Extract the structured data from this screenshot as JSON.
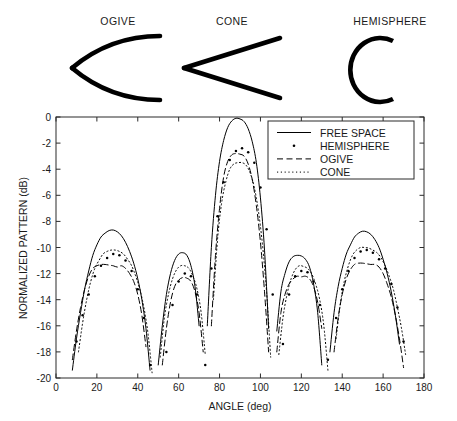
{
  "shapes": {
    "items": [
      {
        "name": "ogive",
        "label": "OGIVE",
        "icon": "ogive-shape-icon"
      },
      {
        "name": "cone",
        "label": "CONE",
        "icon": "cone-shape-icon"
      },
      {
        "name": "hemisphere",
        "label": "HEMISPHERE",
        "icon": "hemisphere-shape-icon"
      }
    ]
  },
  "chart_data": {
    "type": "line",
    "title": "",
    "xlabel": "ANGLE (deg)",
    "ylabel": "NORMALIZED PATTERN (dB)",
    "xlim": [
      0,
      180
    ],
    "ylim": [
      -20,
      0
    ],
    "xticks": [
      0,
      20,
      40,
      60,
      80,
      100,
      120,
      140,
      160,
      180
    ],
    "yticks": [
      0,
      -2,
      -4,
      -6,
      -8,
      -10,
      -12,
      -14,
      -16,
      -18,
      -20
    ],
    "xtick_labels": [
      "0",
      "20",
      "40",
      "60",
      "80",
      "100",
      "120",
      "140",
      "160",
      "180"
    ],
    "ytick_labels": [
      "0",
      "-2",
      "-4",
      "-6",
      "-8",
      "-10",
      "-12",
      "-14",
      "-16",
      "-18",
      "-20"
    ],
    "grid": false,
    "legend_position": "upper right",
    "legend": [
      {
        "name": "FREE SPACE",
        "style": "solid",
        "color": "#000000"
      },
      {
        "name": "HEMISPHERE",
        "style": "dotted-marker",
        "color": "#000000"
      },
      {
        "name": "OGIVE",
        "style": "dashed",
        "color": "#000000"
      },
      {
        "name": "CONE",
        "style": "dotted",
        "color": "#000000"
      }
    ],
    "lobes": {
      "description": "Five-lobe symmetric array pattern; nulls fall below -20 dB",
      "peak_angles": [
        28,
        61,
        90,
        119,
        152
      ],
      "null_angles": [
        8,
        45,
        52,
        70,
        110,
        128,
        135,
        172
      ]
    },
    "series": [
      {
        "name": "FREE SPACE",
        "style": "solid",
        "peaks": [
          {
            "angle": 28,
            "value": -8.7
          },
          {
            "angle": 61,
            "value": -10.4
          },
          {
            "angle": 90,
            "value": -0.2
          },
          {
            "angle": 119,
            "value": -10.6
          },
          {
            "angle": 152,
            "value": -8.8
          }
        ],
        "x": [
          6,
          8,
          10,
          12,
          14,
          16,
          18,
          20,
          22,
          24,
          26,
          28,
          30,
          32,
          34,
          36,
          38,
          40,
          42,
          44,
          46,
          48,
          50,
          52,
          54,
          56,
          58,
          60,
          62,
          64,
          66,
          68,
          70,
          72,
          74,
          76,
          78,
          80,
          82,
          84,
          86,
          88,
          90,
          92,
          94,
          96,
          98,
          100,
          102,
          104,
          106,
          108,
          110,
          112,
          114,
          116,
          118,
          120,
          122,
          124,
          126,
          128,
          130,
          132,
          134,
          136,
          138,
          140,
          142,
          144,
          146,
          148,
          150,
          152,
          154,
          156,
          158,
          160,
          162,
          164,
          166,
          168,
          170,
          172,
          174
        ],
        "y": [
          -20,
          -19.4,
          -17.0,
          -15.0,
          -13.2,
          -11.8,
          -10.6,
          -9.8,
          -9.2,
          -8.9,
          -8.7,
          -8.66,
          -8.8,
          -9.1,
          -9.6,
          -10.3,
          -11.2,
          -12.4,
          -14.0,
          -16.2,
          -19.4,
          -20,
          -19.0,
          -16.0,
          -13.6,
          -12.0,
          -11.0,
          -10.5,
          -10.4,
          -10.6,
          -11.4,
          -13.0,
          -16.0,
          -20,
          -16.0,
          -10.0,
          -6.0,
          -3.4,
          -1.8,
          -0.8,
          -0.3,
          -0.1,
          -0.15,
          -0.35,
          -0.9,
          -1.9,
          -3.5,
          -6.2,
          -10.2,
          -16.2,
          -20,
          -16.4,
          -13.4,
          -12.0,
          -11.1,
          -10.7,
          -10.6,
          -10.65,
          -10.9,
          -11.5,
          -12.8,
          -15.0,
          -19.0,
          -20,
          -18.0,
          -15.0,
          -13.0,
          -11.6,
          -10.5,
          -9.8,
          -9.2,
          -8.9,
          -8.75,
          -8.8,
          -9.0,
          -9.4,
          -10.0,
          -10.9,
          -12.0,
          -13.4,
          -15.2,
          -17.4,
          -20,
          -20,
          -20
        ]
      },
      {
        "name": "HEMISPHERE",
        "style": "dotted-marker",
        "peaks": [
          {
            "angle": 28,
            "value": -10.5
          },
          {
            "angle": 61,
            "value": -12.0
          },
          {
            "angle": 90,
            "value": -2.4
          },
          {
            "angle": 119,
            "value": -11.8
          },
          {
            "angle": 152,
            "value": -10.2
          }
        ],
        "x": [
          7,
          10,
          13,
          16,
          19,
          22,
          25,
          28,
          31,
          34,
          37,
          40,
          43,
          46,
          54,
          57,
          60,
          63,
          66,
          69,
          73,
          76,
          79,
          82,
          85,
          88,
          91,
          94,
          97,
          100,
          103,
          106,
          111,
          114,
          117,
          120,
          123,
          126,
          129,
          133,
          137,
          140,
          143,
          146,
          149,
          152,
          155,
          158,
          161,
          164,
          167,
          170,
          173
        ],
        "y": [
          -20,
          -17.2,
          -15.2,
          -13.6,
          -12.2,
          -11.4,
          -10.8,
          -10.5,
          -10.6,
          -11.0,
          -11.8,
          -13.2,
          -15.4,
          -19.0,
          -18.0,
          -14.4,
          -12.6,
          -12.0,
          -12.2,
          -13.6,
          -19.0,
          -11.6,
          -7.6,
          -5.0,
          -3.3,
          -2.6,
          -2.4,
          -2.7,
          -3.5,
          -5.4,
          -8.6,
          -13.6,
          -17.4,
          -13.6,
          -12.2,
          -11.8,
          -11.9,
          -12.6,
          -14.4,
          -18.6,
          -15.4,
          -13.2,
          -11.8,
          -10.8,
          -10.3,
          -10.2,
          -10.4,
          -10.9,
          -11.6,
          -12.8,
          -14.6,
          -17.2,
          -20
        ]
      },
      {
        "name": "OGIVE",
        "style": "dashed",
        "peaks": [
          {
            "angle": 28,
            "value": -11.4
          },
          {
            "angle": 61,
            "value": -12.3
          },
          {
            "angle": 90,
            "value": -2.8
          },
          {
            "angle": 119,
            "value": -12.2
          },
          {
            "angle": 152,
            "value": -11.2
          }
        ],
        "x": [
          6,
          8,
          10,
          12,
          14,
          16,
          18,
          20,
          22,
          24,
          26,
          28,
          30,
          32,
          34,
          36,
          38,
          40,
          42,
          44,
          46,
          48,
          52,
          54,
          56,
          58,
          60,
          62,
          64,
          66,
          68,
          70,
          72,
          74,
          76,
          78,
          80,
          82,
          84,
          86,
          88,
          90,
          92,
          94,
          96,
          98,
          100,
          102,
          104,
          106,
          108,
          110,
          112,
          114,
          116,
          118,
          120,
          122,
          124,
          126,
          128,
          130,
          134,
          136,
          138,
          140,
          142,
          144,
          146,
          148,
          150,
          152,
          154,
          156,
          158,
          160,
          162,
          164,
          166,
          168,
          170,
          172,
          174
        ],
        "y": [
          -20,
          -18.6,
          -16.4,
          -14.6,
          -13.2,
          -12.2,
          -11.6,
          -11.4,
          -11.3,
          -11.3,
          -11.35,
          -11.4,
          -11.5,
          -11.4,
          -11.6,
          -12.0,
          -12.6,
          -13.6,
          -15.2,
          -17.6,
          -20,
          -20,
          -19.0,
          -16.2,
          -14.2,
          -13.0,
          -12.5,
          -12.3,
          -12.35,
          -12.6,
          -13.4,
          -15.0,
          -18.0,
          -20,
          -16.0,
          -10.6,
          -7.0,
          -4.6,
          -3.4,
          -2.9,
          -2.8,
          -2.85,
          -3.0,
          -3.6,
          -4.8,
          -6.8,
          -9.6,
          -13.4,
          -18.0,
          -20,
          -18.0,
          -15.0,
          -13.6,
          -12.8,
          -12.4,
          -12.2,
          -12.25,
          -12.2,
          -12.4,
          -13.0,
          -14.2,
          -16.2,
          -20,
          -18.0,
          -15.4,
          -13.6,
          -12.4,
          -11.7,
          -11.3,
          -11.2,
          -11.2,
          -11.25,
          -11.3,
          -11.3,
          -11.5,
          -12.0,
          -12.8,
          -13.8,
          -15.2,
          -17.0,
          -19.2,
          -20,
          -20
        ]
      },
      {
        "name": "CONE",
        "style": "dotted",
        "peaks": [
          {
            "angle": 28,
            "value": -10.2
          },
          {
            "angle": 61,
            "value": -11.4
          },
          {
            "angle": 90,
            "value": -3.5
          },
          {
            "angle": 119,
            "value": -11.4
          },
          {
            "angle": 152,
            "value": -10.0
          }
        ],
        "x": [
          9,
          11,
          13,
          15,
          17,
          19,
          21,
          23,
          25,
          27,
          29,
          31,
          33,
          35,
          37,
          39,
          41,
          43,
          45,
          47,
          49,
          51,
          53,
          55,
          57,
          59,
          61,
          63,
          65,
          67,
          69,
          71,
          73,
          75,
          77,
          79,
          81,
          83,
          85,
          87,
          89,
          91,
          93,
          95,
          97,
          99,
          101,
          103,
          105,
          107,
          109,
          111,
          113,
          115,
          117,
          119,
          121,
          123,
          125,
          127,
          129,
          131,
          133,
          135,
          137,
          139,
          141,
          143,
          145,
          147,
          149,
          151,
          153,
          155,
          157,
          159,
          161,
          163,
          165,
          167,
          169,
          171,
          173,
          175
        ],
        "y": [
          -20,
          -18.0,
          -15.8,
          -14.0,
          -12.6,
          -11.6,
          -11.0,
          -10.5,
          -10.3,
          -10.2,
          -10.2,
          -10.3,
          -10.5,
          -10.9,
          -11.4,
          -12.2,
          -13.2,
          -14.6,
          -16.6,
          -19.6,
          -20,
          -18.4,
          -15.4,
          -13.6,
          -12.4,
          -11.7,
          -11.4,
          -11.4,
          -11.6,
          -12.2,
          -13.2,
          -15.0,
          -18.2,
          -20,
          -14.0,
          -9.4,
          -6.6,
          -5.0,
          -4.0,
          -3.6,
          -3.5,
          -3.5,
          -3.7,
          -4.3,
          -5.4,
          -7.2,
          -9.8,
          -13.4,
          -18.4,
          -20,
          -18.2,
          -15.4,
          -13.6,
          -12.4,
          -11.7,
          -11.4,
          -11.45,
          -11.6,
          -12.0,
          -12.8,
          -14.0,
          -16.0,
          -19.4,
          -20,
          -17.0,
          -14.4,
          -12.6,
          -11.4,
          -10.6,
          -10.2,
          -10.0,
          -10.0,
          -10.05,
          -10.2,
          -10.4,
          -10.8,
          -11.4,
          -12.2,
          -13.2,
          -14.6,
          -16.2,
          -18.2,
          -20,
          -20
        ]
      }
    ]
  }
}
